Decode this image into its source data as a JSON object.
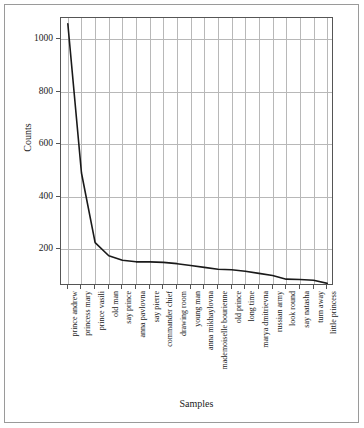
{
  "chart_data": {
    "type": "line",
    "title": "",
    "xlabel": "Samples",
    "ylabel": "Counts",
    "categories": [
      "prince andrew",
      "princess mary",
      "prince vasili",
      "old man",
      "say prince",
      "anna pavlovna",
      "say pierre",
      "commander chief",
      "drawing room",
      "young man",
      "anna mikhaylovna",
      "mademoiselle bourienne",
      "old prince",
      "long time",
      "marya dmitrievna",
      "russian army",
      "look round",
      "say natasha",
      "turn away",
      "little princess"
    ],
    "values": [
      1058,
      490,
      225,
      175,
      158,
      152,
      152,
      150,
      145,
      138,
      131,
      124,
      122,
      116,
      108,
      100,
      86,
      85,
      82,
      70
    ],
    "ylim": [
      60,
      1080
    ],
    "yticks": [
      200,
      400,
      600,
      800,
      1000
    ],
    "ytick_labels": [
      "200",
      "400",
      "600",
      "800",
      "1000"
    ],
    "grid": true,
    "legend": "none",
    "line_color": "#1a1a1a",
    "grid_color": "#b8b8b8",
    "axis_color": "#555555",
    "background": "#ffffff"
  }
}
